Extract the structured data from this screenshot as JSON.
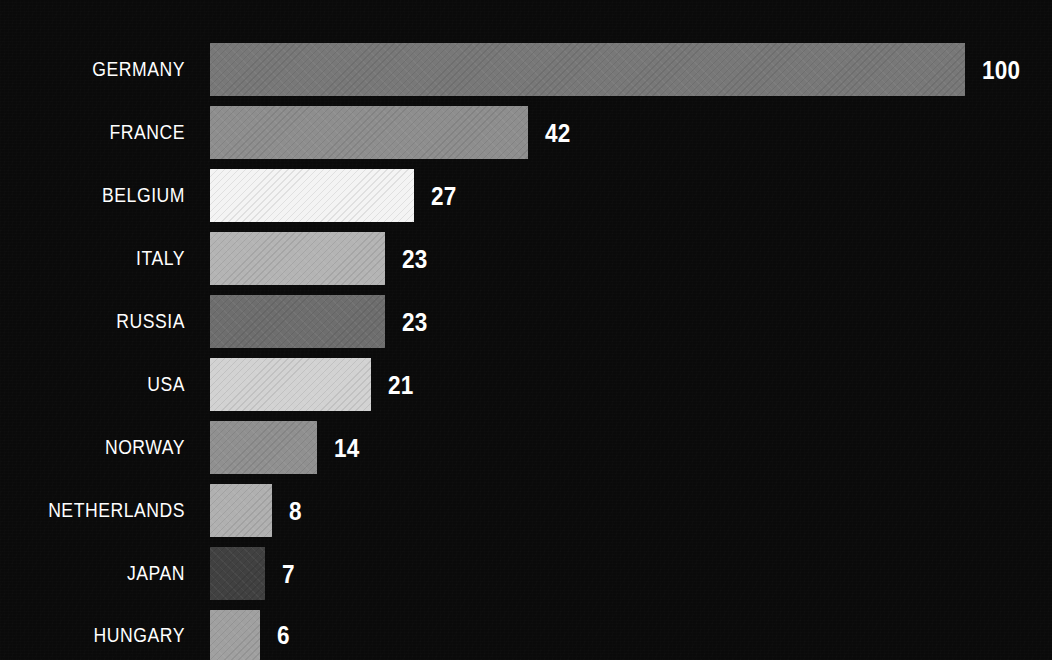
{
  "chart_data": {
    "type": "bar",
    "orientation": "horizontal",
    "title": "",
    "subtitle": "",
    "xlabel": "",
    "ylabel": "",
    "grid": false,
    "legend": null,
    "background_color": "#0a0a0a",
    "text_color": "#ffffff",
    "categories": [
      "GERMANY",
      "FRANCE",
      "BELGIUM",
      "ITALY",
      "RUSSIA",
      "USA",
      "NORWAY",
      "NETHERLANDS",
      "JAPAN",
      "HUNGARY"
    ],
    "values": [
      100,
      42,
      27,
      23,
      23,
      21,
      14,
      8,
      7,
      6
    ],
    "value_labels": [
      "100",
      "42",
      "27",
      "23",
      "23",
      "21",
      "14",
      "8",
      "7",
      "6"
    ],
    "xlim": [
      0,
      100
    ],
    "bars": [
      {
        "category": "GERMANY",
        "value": 100,
        "label": "100",
        "color": "#787878",
        "top": 43,
        "height": 53,
        "width": 755
      },
      {
        "category": "FRANCE",
        "value": 42,
        "label": "42",
        "color": "#8e8e8e",
        "top": 106,
        "height": 53,
        "width": 318
      },
      {
        "category": "BELGIUM",
        "value": 27,
        "label": "27",
        "color": "#f4f4f4",
        "top": 169,
        "height": 53,
        "width": 204
      },
      {
        "category": "ITALY",
        "value": 23,
        "label": "23",
        "color": "#b4b4b4",
        "top": 232,
        "height": 53,
        "width": 175
      },
      {
        "category": "RUSSIA",
        "value": 23,
        "label": "23",
        "color": "#6e6e6e",
        "top": 295,
        "height": 53,
        "width": 175
      },
      {
        "category": "USA",
        "value": 21,
        "label": "21",
        "color": "#d2d2d2",
        "top": 358,
        "height": 53,
        "width": 161
      },
      {
        "category": "NORWAY",
        "value": 14,
        "label": "14",
        "color": "#909090",
        "top": 421,
        "height": 53,
        "width": 107
      },
      {
        "category": "NETHERLANDS",
        "value": 8,
        "label": "8",
        "color": "#b0b0b0",
        "top": 484,
        "height": 53,
        "width": 62
      },
      {
        "category": "JAPAN",
        "value": 7,
        "label": "7",
        "color": "#414141",
        "top": 547,
        "height": 53,
        "width": 55
      },
      {
        "category": "HUNGARY",
        "value": 6,
        "label": "6",
        "color": "#a0a0a0",
        "top": 610,
        "height": 50,
        "width": 50
      }
    ]
  }
}
